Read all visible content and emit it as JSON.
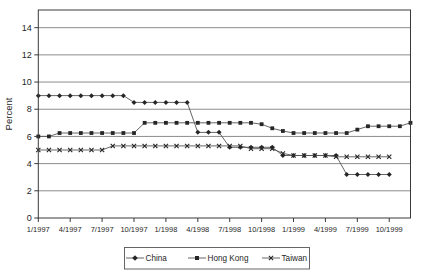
{
  "chart": {
    "ylabel": "Percent",
    "colors": {
      "background": "#ffffff",
      "frame": "#3a3a3a",
      "grid": "#6e6e6e",
      "line": "#555555",
      "marker": "#262626",
      "text": "#1f1f1f",
      "legend_border": "#555555"
    },
    "legend": {
      "position": "bottom-center",
      "items": [
        {
          "label": "China",
          "marker": "diamond"
        },
        {
          "label": "Hong Kong",
          "marker": "square"
        },
        {
          "label": "Taiwan",
          "marker": "x"
        }
      ]
    }
  },
  "chart_data": {
    "type": "line",
    "title": "",
    "xlabel": "",
    "ylabel": "Percent",
    "months": 36,
    "x_start": "1/1997",
    "x_end": "12/1999",
    "x_tick_indices": [
      0,
      3,
      6,
      9,
      12,
      15,
      18,
      21,
      24,
      27,
      30,
      33
    ],
    "x_tick_labels": [
      "1/1997",
      "4/1997",
      "7/1997",
      "10/1997",
      "1/1998",
      "4/1998",
      "7/1998",
      "10/1998",
      "1/1999",
      "4/1999",
      "7/1999",
      "10/1999"
    ],
    "y_ticks": [
      0,
      2,
      4,
      6,
      8,
      10,
      12,
      14
    ],
    "y_tick_labels": [
      "0",
      "2",
      "4",
      "6",
      "8",
      "10",
      "12",
      "14"
    ],
    "ylim": [
      0,
      15.3
    ],
    "grid": "horizontal",
    "legend_position": "bottom",
    "series": [
      {
        "name": "China",
        "marker": "diamond",
        "values": [
          9,
          9,
          9,
          9,
          9,
          9,
          9,
          9,
          9,
          8.5,
          8.5,
          8.5,
          8.5,
          8.5,
          8.5,
          6.3,
          6.3,
          6.3,
          5.2,
          5.2,
          5.2,
          5.2,
          5.2,
          4.6,
          4.6,
          4.6,
          4.6,
          4.6,
          4.6,
          3.2,
          3.2,
          3.2,
          3.2,
          3.2,
          null,
          null
        ]
      },
      {
        "name": "Hong Kong",
        "marker": "square",
        "values": [
          6,
          6,
          6.25,
          6.25,
          6.25,
          6.25,
          6.25,
          6.25,
          6.25,
          6.25,
          7,
          7,
          7,
          7,
          7,
          7,
          7,
          7,
          7,
          7,
          7,
          6.9,
          6.6,
          6.4,
          6.25,
          6.25,
          6.25,
          6.25,
          6.25,
          6.25,
          6.5,
          6.75,
          6.75,
          6.75,
          6.75,
          7
        ]
      },
      {
        "name": "Taiwan",
        "marker": "x",
        "values": [
          5,
          5,
          5,
          5,
          5,
          5,
          5,
          5.3,
          5.3,
          5.3,
          5.3,
          5.3,
          5.3,
          5.3,
          5.3,
          5.3,
          5.3,
          5.3,
          5.3,
          5.3,
          5.1,
          5.1,
          5.1,
          4.75,
          4.6,
          4.6,
          4.6,
          4.6,
          4.5,
          4.5,
          4.5,
          4.5,
          4.5,
          4.5,
          null,
          null
        ]
      }
    ]
  }
}
